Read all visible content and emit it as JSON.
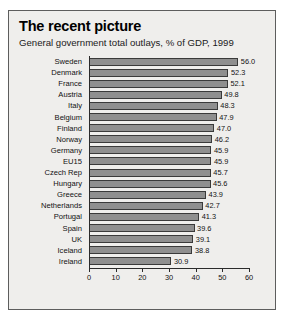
{
  "chart_data": {
    "type": "bar",
    "orientation": "horizontal",
    "title": "The recent picture",
    "subtitle": "General government total outlays, % of GDP, 1999",
    "xlabel": "",
    "ylabel": "",
    "xlim": [
      0,
      60
    ],
    "xticks": [
      0,
      10,
      20,
      30,
      40,
      50,
      60
    ],
    "grid": false,
    "legend": null,
    "bar_color": "#8f8f8f",
    "bar_edge_color": "#3a3a3a",
    "background_color": "#efeeec",
    "categories": [
      "Sweden",
      "Denmark",
      "France",
      "Austria",
      "Italy",
      "Belgium",
      "Finland",
      "Norway",
      "Germany",
      "EU15",
      "Czech Rep",
      "Hungary",
      "Greece",
      "Netherlands",
      "Portugal",
      "Spain",
      "UK",
      "Iceland",
      "Ireland"
    ],
    "values": [
      56.0,
      52.3,
      52.1,
      49.8,
      48.3,
      47.9,
      47.0,
      46.2,
      45.9,
      45.9,
      45.7,
      45.6,
      43.9,
      42.7,
      41.3,
      39.6,
      39.1,
      38.8,
      30.9
    ],
    "value_labels": [
      "56.0",
      "52.3",
      "52.1",
      "49.8",
      "48.3",
      "47.9",
      "47.0",
      "46.2",
      "45.9",
      "45.9",
      "45.7",
      "45.6",
      "43.9",
      "42.7",
      "41.3",
      "39.6",
      "39.1",
      "38.8",
      "30.9"
    ],
    "tick_labels": [
      "0",
      "10",
      "20",
      "30",
      "40",
      "50",
      "60"
    ]
  }
}
